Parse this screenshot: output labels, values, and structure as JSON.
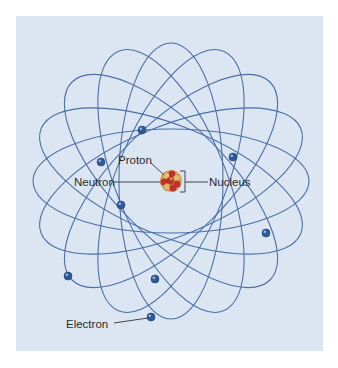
{
  "labels": {
    "proton": "Proton",
    "neutron": "Neutron",
    "nucleus": "Nucleus",
    "electron": "Electron"
  },
  "colors": {
    "background": "#dce6f2",
    "orbit": "#4a6fa8",
    "electron": "#2f5a9a",
    "nucleus_red": "#c0332a",
    "nucleus_tan": "#d9a95a",
    "leader_line": "#333333"
  },
  "nucleus": {
    "cx": 171,
    "cy": 181,
    "r": 11
  },
  "orbits": [
    {
      "angle": 0,
      "rx": 138,
      "ry": 52
    },
    {
      "angle": 22,
      "rx": 140,
      "ry": 55
    },
    {
      "angle": 45,
      "rx": 140,
      "ry": 56
    },
    {
      "angle": 68,
      "rx": 140,
      "ry": 55
    },
    {
      "angle": 90,
      "rx": 138,
      "ry": 52
    },
    {
      "angle": 112,
      "rx": 140,
      "ry": 55
    },
    {
      "angle": 135,
      "rx": 140,
      "ry": 56
    },
    {
      "angle": 158,
      "rx": 140,
      "ry": 55
    }
  ],
  "electrons": [
    {
      "x": 142,
      "y": 130
    },
    {
      "x": 101,
      "y": 162
    },
    {
      "x": 233,
      "y": 157
    },
    {
      "x": 121,
      "y": 205
    },
    {
      "x": 266,
      "y": 233
    },
    {
      "x": 68,
      "y": 276
    },
    {
      "x": 155,
      "y": 279
    },
    {
      "x": 151,
      "y": 317
    }
  ]
}
